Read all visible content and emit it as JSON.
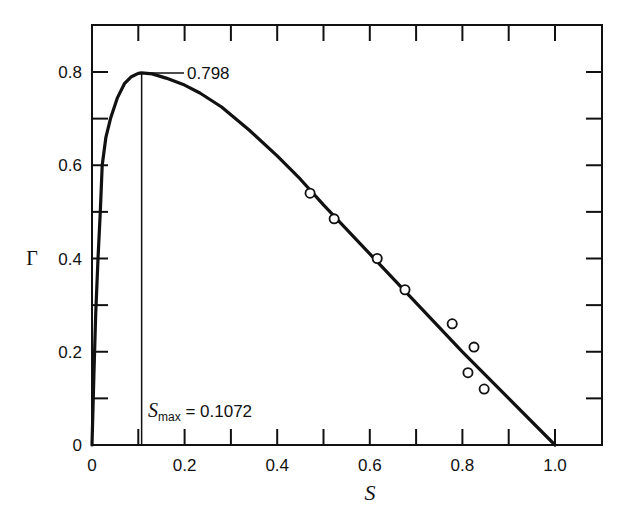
{
  "chart_data": {
    "type": "line",
    "title": "",
    "xlabel": "S",
    "ylabel": "Γ",
    "xlim": [
      0,
      1.1
    ],
    "ylim": [
      0,
      0.9
    ],
    "grid": false,
    "legend": null,
    "x_ticks": [
      0,
      0.1,
      0.2,
      0.3,
      0.4,
      0.5,
      0.6,
      0.7,
      0.8,
      0.9,
      1.0
    ],
    "x_tick_labels": [
      "0",
      "",
      "0.2",
      "",
      "0.4",
      "",
      "0.6",
      "",
      "0.8",
      "",
      "1.0"
    ],
    "y_ticks": [
      0,
      0.1,
      0.2,
      0.3,
      0.4,
      0.5,
      0.6,
      0.7,
      0.8
    ],
    "y_tick_labels": [
      "0",
      "",
      "0.2",
      "",
      "0.4",
      "",
      "0.6",
      "",
      "0.8"
    ],
    "series": [
      {
        "name": "theoretical curve",
        "style": "line",
        "x": [
          0,
          0.004,
          0.008,
          0.013,
          0.018,
          0.022,
          0.03,
          0.04,
          0.055,
          0.07,
          0.085,
          0.1,
          0.1072,
          0.13,
          0.16,
          0.2,
          0.233,
          0.28,
          0.34,
          0.4,
          0.45,
          0.5,
          0.6,
          0.7,
          0.8,
          0.9,
          1.0
        ],
        "y": [
          0,
          0.15,
          0.28,
          0.4,
          0.5,
          0.6,
          0.66,
          0.7,
          0.745,
          0.775,
          0.79,
          0.797,
          0.798,
          0.796,
          0.787,
          0.772,
          0.755,
          0.725,
          0.675,
          0.62,
          0.57,
          0.515,
          0.41,
          0.305,
          0.2,
          0.1,
          0
        ]
      },
      {
        "name": "experimental data",
        "style": "open-circle",
        "x": [
          0.471,
          0.523,
          0.616,
          0.676,
          0.778,
          0.825,
          0.812,
          0.847
        ],
        "y": [
          0.54,
          0.485,
          0.4,
          0.333,
          0.26,
          0.21,
          0.155,
          0.12
        ]
      }
    ],
    "annotations": [
      {
        "text": "0.798",
        "x": 0.1072,
        "y": 0.798,
        "type": "leader-line-label"
      },
      {
        "text_main": "S",
        "text_sub": "max",
        "text_tail": " = 0.1072",
        "x": 0.1072,
        "type": "vertical-line-label"
      }
    ]
  },
  "labels": {
    "x_axis_title": "S",
    "y_axis_title": "Γ",
    "peak_value": "0.798",
    "smax_main": "S",
    "smax_sub": "max",
    "smax_tail": " = 0.1072"
  }
}
